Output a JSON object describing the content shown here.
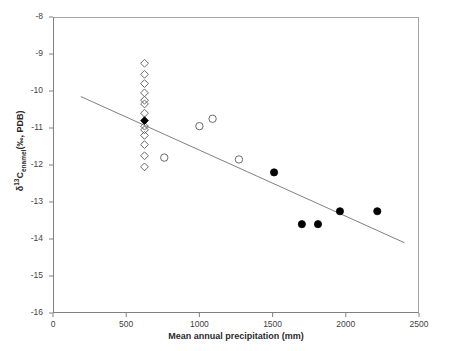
{
  "chart_data": {
    "type": "scatter",
    "title": "",
    "xlabel": "Mean annual precipitation (mm)",
    "ylabel_parts": {
      "delta": "δ",
      "superscript": "13",
      "element": "C",
      "subscript": "enamel",
      "units": "(‰, PDB)"
    },
    "ylabel": "δ13Cenamel(‰, PDB)",
    "xlim": [
      0,
      2500
    ],
    "ylim": [
      -16,
      -8
    ],
    "xticks": [
      0,
      500,
      1000,
      1500,
      2000,
      2500
    ],
    "yticks": [
      -8,
      -9,
      -10,
      -11,
      -12,
      -13,
      -14,
      -15,
      -16
    ],
    "xtick_labels": [
      "0",
      "500",
      "1000",
      "1500",
      "2000",
      "2500"
    ],
    "ytick_labels": [
      "-8",
      "-9",
      "-10",
      "-11",
      "-12",
      "-13",
      "-14",
      "-15",
      "-16"
    ],
    "grid": false,
    "legend": "none",
    "series": [
      {
        "name": "open-diamonds",
        "marker": "diamond",
        "fill": "none",
        "edge_color": "#595959",
        "points": [
          {
            "x": 625,
            "y": -9.25
          },
          {
            "x": 625,
            "y": -9.55
          },
          {
            "x": 625,
            "y": -9.8
          },
          {
            "x": 625,
            "y": -10.05
          },
          {
            "x": 625,
            "y": -10.25
          },
          {
            "x": 625,
            "y": -10.35
          },
          {
            "x": 625,
            "y": -10.6
          },
          {
            "x": 625,
            "y": -10.95
          },
          {
            "x": 625,
            "y": -11.05
          },
          {
            "x": 625,
            "y": -11.2
          },
          {
            "x": 625,
            "y": -11.45
          },
          {
            "x": 625,
            "y": -11.75
          },
          {
            "x": 625,
            "y": -12.05
          }
        ]
      },
      {
        "name": "filled-diamond",
        "marker": "diamond",
        "fill": "#000000",
        "edge_color": "#000000",
        "points": [
          {
            "x": 625,
            "y": -10.8
          }
        ]
      },
      {
        "name": "open-circles",
        "marker": "circle",
        "fill": "none",
        "edge_color": "#595959",
        "points": [
          {
            "x": 760,
            "y": -11.8
          },
          {
            "x": 1000,
            "y": -10.95
          },
          {
            "x": 1090,
            "y": -10.75
          },
          {
            "x": 1270,
            "y": -11.85
          }
        ]
      },
      {
        "name": "filled-circles",
        "marker": "circle",
        "fill": "#000000",
        "edge_color": "#000000",
        "points": [
          {
            "x": 1510,
            "y": -12.2
          },
          {
            "x": 1700,
            "y": -13.6
          },
          {
            "x": 1810,
            "y": -13.6
          },
          {
            "x": 1960,
            "y": -13.25
          },
          {
            "x": 2215,
            "y": -13.25
          }
        ]
      }
    ],
    "trendline": {
      "name": "regression-line",
      "color": "#808080",
      "x_start": 190,
      "y_start": -10.15,
      "x_end": 2400,
      "y_end": -14.1
    }
  }
}
